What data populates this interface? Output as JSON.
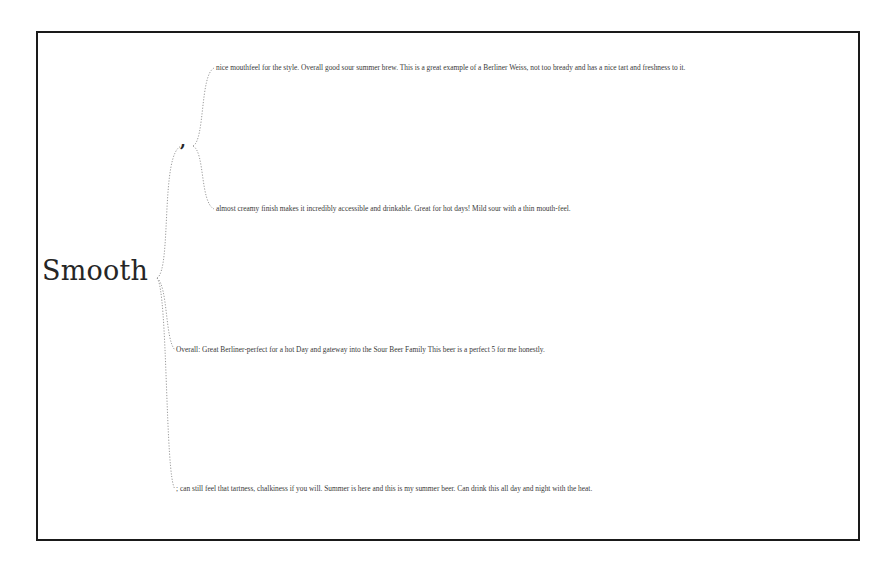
{
  "word_tree": {
    "root": {
      "label": "Smooth"
    },
    "branches": [
      {
        "label": ",",
        "children": [
          {
            "label": "nice mouthfeel for the style. Overall good sour summer brew. This is a great example of a Berliner Weiss, not too bready and has a nice tart and freshness to it."
          },
          {
            "label": "almost creamy finish makes it incredibly accessible and drinkable. Great for hot days! Mild sour with a thin mouth-feel."
          }
        ]
      },
      {
        "label": "Overall: Great Berliner-perfect for a hot Day and gateway into the Sour Beer Family This beer is a perfect 5 for me honestly."
      },
      {
        "label": "; can still feel that tartness, chalkiness if you will. Summer is here and this is my summer beer. Can drink this all day and night with the heat."
      }
    ]
  },
  "colors": {
    "border": "#1a1a1a",
    "link": "#9a9a9a",
    "root_text": "#262626",
    "leaf_text": "#3a3a3a",
    "background": "#ffffff"
  }
}
